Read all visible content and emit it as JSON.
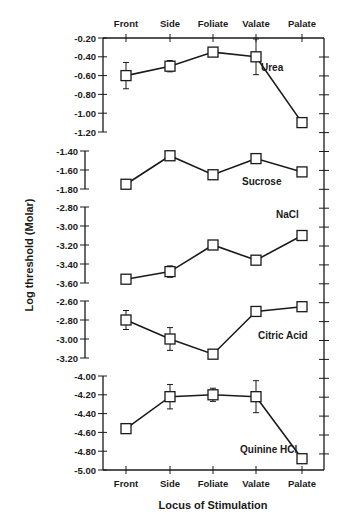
{
  "chart_data": {
    "type": "line",
    "title": "",
    "xlabel": "Locus of Stimulation",
    "ylabel": "Log threshold (Molar)",
    "categories": [
      "Front",
      "Side",
      "Foliate",
      "Valate",
      "Palate"
    ],
    "grid": false,
    "panels": [
      {
        "name": "Urea",
        "label_pos": [
          261,
          71
        ],
        "ylim": [
          -1.2,
          -0.2
        ],
        "ticks": [
          -0.2,
          -0.4,
          -0.6,
          -0.8,
          -1.0,
          -1.2
        ],
        "tick_labels": [
          "-0.20",
          "-0.40",
          "-0.60",
          "-0.80",
          "-1.00",
          "-1.20"
        ],
        "y_top": 38,
        "y_bottom": 132,
        "values": [
          -0.6,
          -0.5,
          -0.35,
          -0.4,
          -1.1
        ],
        "err": [
          0.14,
          0.06,
          0.0,
          0.19,
          0.04
        ]
      },
      {
        "name": "Sucrose",
        "label_pos": [
          242,
          185
        ],
        "ylim": [
          -1.8,
          -1.4
        ],
        "ticks": [
          -1.4,
          -1.6,
          -1.8
        ],
        "tick_labels": [
          "-1.40",
          "-1.60",
          "-1.80"
        ],
        "y_top": 151,
        "y_bottom": 189,
        "values": [
          -1.75,
          -1.45,
          -1.65,
          -1.48,
          -1.62
        ],
        "err": [
          0.05,
          0.0,
          0.03,
          0.05,
          0.0
        ]
      },
      {
        "name": "NaCl",
        "label_pos": [
          276,
          218
        ],
        "ylim": [
          -3.6,
          -2.8
        ],
        "ticks": [
          -2.8,
          -3.0,
          -3.2,
          -3.4,
          -3.6
        ],
        "tick_labels": [
          "-2.80",
          "-3.00",
          "-3.20",
          "-3.40",
          "-3.60"
        ],
        "y_top": 207,
        "y_bottom": 283,
        "values": [
          -3.56,
          -3.48,
          -3.2,
          -3.36,
          -3.1
        ],
        "err": [
          0.03,
          0.06,
          0.04,
          0.0,
          0.0
        ]
      },
      {
        "name": "Citric Acid",
        "label_pos": [
          258,
          339
        ],
        "ylim": [
          -3.2,
          -2.6
        ],
        "ticks": [
          -2.6,
          -2.8,
          -3.0,
          -3.2
        ],
        "tick_labels": [
          "-2.60",
          "-2.80",
          "-3.00",
          "-3.20"
        ],
        "y_top": 301,
        "y_bottom": 358,
        "values": [
          -2.8,
          -3.0,
          -3.16,
          -2.71,
          -2.66
        ],
        "err": [
          0.1,
          0.12,
          0.02,
          0.03,
          0.03
        ]
      },
      {
        "name": "Quinine HCl",
        "label_pos": [
          240,
          453
        ],
        "ylim": [
          -5.0,
          -4.0
        ],
        "ticks": [
          -4.0,
          -4.2,
          -4.4,
          -4.6,
          -4.8,
          -5.0
        ],
        "tick_labels": [
          "-4.00",
          "-4.20",
          "-4.40",
          "-4.60",
          "-4.80",
          "-5.00"
        ],
        "y_top": 376,
        "y_bottom": 470,
        "values": [
          -4.56,
          -4.22,
          -4.2,
          -4.22,
          -4.88
        ],
        "err": [
          0.04,
          0.13,
          0.07,
          0.17,
          0.0
        ]
      }
    ],
    "layout": {
      "x_positions": [
        126,
        170,
        213,
        256,
        302
      ],
      "left_axis_x": 103,
      "right_axis_x": 324,
      "top_axis_y": 38,
      "bottom_axis_y": 470
    }
  }
}
